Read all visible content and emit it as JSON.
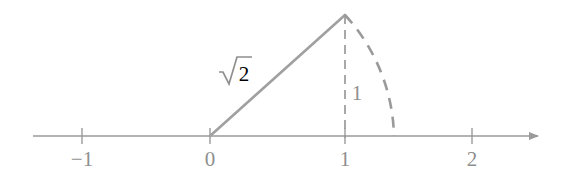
{
  "figure": {
    "background_color": "#ffffff",
    "stroke_color": "#9a9a9a",
    "label_color": "#8f8f8f",
    "axis": {
      "name": "number-line",
      "y_pixel": 136,
      "x_start_pixel": 33,
      "x_end_pixel": 545,
      "origin_pixel": 210,
      "unit_pixels": 131,
      "has_right_arrowhead": true,
      "has_left_arrowhead": false
    },
    "ticks": [
      {
        "value": -1,
        "label": "−1",
        "x_pixel": 82
      },
      {
        "value": 0,
        "label": "0",
        "x_pixel": 210
      },
      {
        "value": 1,
        "label": "1",
        "x_pixel": 345
      },
      {
        "value": 2,
        "label": "2",
        "x_pixel": 472
      }
    ],
    "triangle": {
      "name": "right-triangle",
      "vertex_origin": {
        "x": 0,
        "y": 0,
        "x_pixel": 210,
        "y_pixel": 136
      },
      "vertex_apex": {
        "x": 1,
        "y": 1,
        "x_pixel": 345,
        "y_pixel": 15
      },
      "vertex_foot": {
        "x": 1,
        "y": 0,
        "x_pixel": 345,
        "y_pixel": 136
      },
      "hypotenuse_style": "solid",
      "vertical_leg_style": "dashed",
      "base_leg_style": "on-axis"
    },
    "arc": {
      "name": "compass-arc",
      "center": {
        "x": 0,
        "y": 0
      },
      "radius_value": 1.41421356,
      "radius_label": "√2",
      "from": {
        "x": 1,
        "y": 1,
        "x_pixel": 345,
        "y_pixel": 15
      },
      "to": {
        "x": 1.41421356,
        "y": 0,
        "x_pixel": 394,
        "y_pixel": 136
      },
      "style": "dashed"
    },
    "labels": {
      "hypotenuse": {
        "text": "√2",
        "radicand": "2",
        "x_pixel": 236,
        "y_pixel": 78
      },
      "vertical_leg": {
        "text": "1",
        "x_pixel": 357,
        "y_pixel": 93
      }
    }
  }
}
